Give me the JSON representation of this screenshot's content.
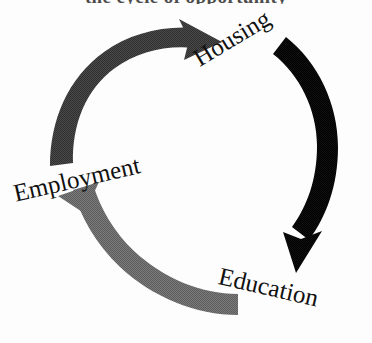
{
  "figure": {
    "type": "cycle-diagram",
    "clipped_heading_text": "the cycle of opportunity",
    "background_color": "#fdfdfd",
    "label_color": "#111111"
  },
  "nodes": [
    {
      "id": "housing",
      "label": "Housing",
      "position": "top-right",
      "rotation_deg": -31
    },
    {
      "id": "education",
      "label": "Education",
      "position": "bottom-right",
      "rotation_deg": 13
    },
    {
      "id": "employment",
      "label": "Employment",
      "position": "left",
      "rotation_deg": -13
    }
  ],
  "arrows": [
    {
      "id": "housing-to-education",
      "from": "housing",
      "to": "education",
      "color": "#0d0d0d",
      "tone": "black",
      "side": "right",
      "direction": "clockwise-down"
    },
    {
      "id": "education-to-employment",
      "from": "education",
      "to": "employment",
      "color": "#6e6e6e",
      "tone": "medium-gray",
      "side": "bottom",
      "direction": "clockwise-up-left"
    },
    {
      "id": "employment-to-housing",
      "from": "employment",
      "to": "housing",
      "color": "#4a4a4a",
      "tone": "dark-gray",
      "side": "upper-left",
      "direction": "clockwise-up-right"
    }
  ]
}
